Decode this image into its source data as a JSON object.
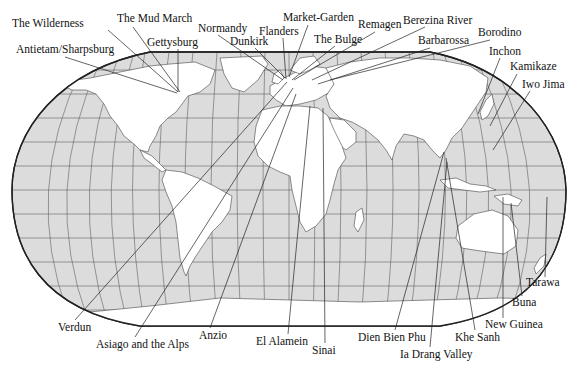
{
  "map": {
    "title": "World map of battles",
    "colors": {
      "ocean": "#dcdcdc",
      "land": "#ffffff",
      "outline": "#222222",
      "text": "#111111"
    }
  },
  "labels": [
    {
      "id": "the-wilderness",
      "text": "The Wilderness",
      "x": 12,
      "y": 27,
      "anchor": "start",
      "line": [
        108,
        30,
        178,
        92
      ]
    },
    {
      "id": "the-mud-march",
      "text": "The Mud March",
      "x": 117,
      "y": 22,
      "anchor": "start",
      "line": [
        133,
        27,
        180,
        92
      ]
    },
    {
      "id": "gettysburg",
      "text": "Gettysburg",
      "x": 147,
      "y": 46,
      "anchor": "start",
      "line": [
        178,
        49,
        178,
        92
      ]
    },
    {
      "id": "antietam",
      "text": "Antietam/Sharpsburg",
      "x": 16,
      "y": 53,
      "anchor": "start",
      "line": [
        65,
        57,
        177,
        93
      ]
    },
    {
      "id": "normandy",
      "text": "Normandy",
      "x": 198,
      "y": 32,
      "anchor": "start",
      "line": [
        218,
        35,
        283,
        80
      ]
    },
    {
      "id": "dunkirk",
      "text": "Dunkirk",
      "x": 230,
      "y": 45,
      "anchor": "start",
      "line": [
        255,
        48,
        285,
        78
      ]
    },
    {
      "id": "flanders",
      "text": "Flanders",
      "x": 259,
      "y": 35,
      "anchor": "start",
      "line": [
        283,
        38,
        286,
        79
      ]
    },
    {
      "id": "market-garden",
      "text": "Market-Garden",
      "x": 283,
      "y": 21,
      "anchor": "start",
      "line": [
        308,
        25,
        289,
        77
      ]
    },
    {
      "id": "the-bulge",
      "text": "The Bulge",
      "x": 314,
      "y": 43,
      "anchor": "start",
      "line": [
        335,
        46,
        292,
        80
      ]
    },
    {
      "id": "remagen",
      "text": "Remagen",
      "x": 358,
      "y": 28,
      "anchor": "start",
      "line": [
        375,
        32,
        294,
        80
      ]
    },
    {
      "id": "berezina",
      "text": "Berezina River",
      "x": 403,
      "y": 24,
      "anchor": "start",
      "line": [
        425,
        27,
        312,
        80
      ]
    },
    {
      "id": "barbarossa",
      "text": "Barbarossa",
      "x": 418,
      "y": 44,
      "anchor": "start",
      "line": [
        430,
        48,
        318,
        84
      ]
    },
    {
      "id": "borodino",
      "text": "Borodino",
      "x": 478,
      "y": 36,
      "anchor": "start",
      "line": [
        490,
        40,
        330,
        80
      ]
    },
    {
      "id": "inchon",
      "text": "Inchon",
      "x": 489,
      "y": 55,
      "anchor": "start",
      "line": [
        500,
        58,
        478,
        114
      ]
    },
    {
      "id": "kamikaze",
      "text": "Kamikaze",
      "x": 510,
      "y": 70,
      "anchor": "start",
      "line": [
        517,
        74,
        490,
        126
      ]
    },
    {
      "id": "iwo-jima",
      "text": "Iwo Jima",
      "x": 522,
      "y": 88,
      "anchor": "start",
      "line": [
        530,
        91,
        493,
        150
      ]
    },
    {
      "id": "verdun",
      "text": "Verdun",
      "x": 58,
      "y": 331,
      "anchor": "start",
      "line": [
        75,
        320,
        287,
        82
      ]
    },
    {
      "id": "asiago",
      "text": "Asiago and the Alps",
      "x": 96,
      "y": 348,
      "anchor": "start",
      "line": [
        135,
        337,
        293,
        88
      ]
    },
    {
      "id": "anzio",
      "text": "Anzio",
      "x": 199,
      "y": 339,
      "anchor": "start",
      "line": [
        210,
        328,
        296,
        94
      ]
    },
    {
      "id": "el-alamein",
      "text": "El Alamein",
      "x": 256,
      "y": 345,
      "anchor": "start",
      "line": [
        288,
        334,
        310,
        106
      ]
    },
    {
      "id": "sinai",
      "text": "Sinai",
      "x": 312,
      "y": 354,
      "anchor": "start",
      "line": [
        325,
        343,
        323,
        108
      ]
    },
    {
      "id": "dien-bien-phu",
      "text": "Dien Bien Phu",
      "x": 358,
      "y": 341,
      "anchor": "start",
      "line": [
        395,
        330,
        444,
        152
      ]
    },
    {
      "id": "ia-drang",
      "text": "Ia Drang Valley",
      "x": 400,
      "y": 358,
      "anchor": "start",
      "line": [
        430,
        347,
        447,
        162
      ]
    },
    {
      "id": "khe-sanh",
      "text": "Khe Sanh",
      "x": 455,
      "y": 341,
      "anchor": "start",
      "line": [
        475,
        330,
        446,
        158
      ]
    },
    {
      "id": "new-guinea",
      "text": "New Guinea",
      "x": 485,
      "y": 328,
      "anchor": "start",
      "line": [
        503,
        318,
        503,
        197
      ]
    },
    {
      "id": "buna",
      "text": "Buna",
      "x": 512,
      "y": 306,
      "anchor": "start",
      "line": [
        522,
        296,
        511,
        203
      ]
    },
    {
      "id": "tarawa",
      "text": "Tarawa",
      "x": 526,
      "y": 286,
      "anchor": "start",
      "line": [
        545,
        277,
        547,
        197
      ]
    }
  ]
}
